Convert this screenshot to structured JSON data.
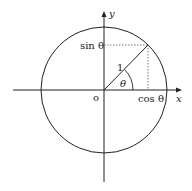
{
  "diagram": {
    "labels": {
      "x_axis": "x",
      "y_axis": "y",
      "origin": "o",
      "radius": "1",
      "angle": "θ",
      "sin": "sin θ",
      "cos": "cos θ"
    },
    "colors": {
      "stroke": "#222222",
      "dashed": "#555555",
      "background": "#ffffff"
    },
    "geometry": {
      "center": [
        104,
        90
      ],
      "radius": 63,
      "angle_deg": 45
    }
  }
}
